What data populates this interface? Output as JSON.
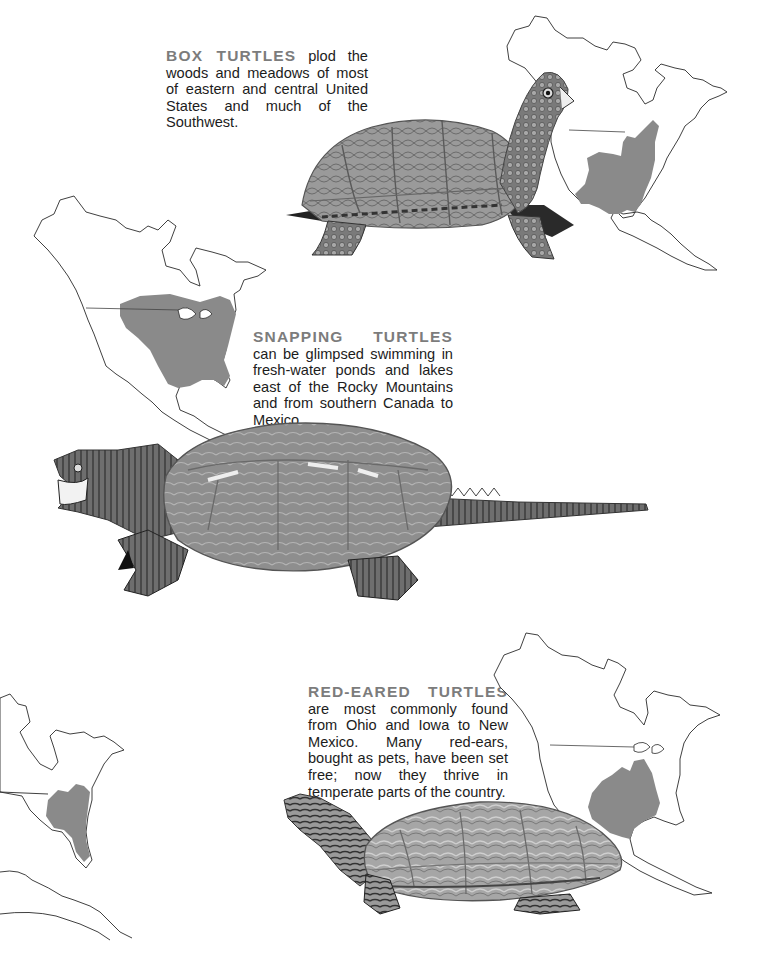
{
  "page": {
    "background": "#ffffff",
    "heading_color": "#7c7c7c",
    "range_fill_color": "#8a8a8a"
  },
  "sections": [
    {
      "id": "box",
      "heading": "BOX TURTLES",
      "body": " plod the woods and meadows of most of eastern and central United States and much of the Southwest.",
      "map_label": "box-turtle-range-map",
      "illustration": "box-turtle-illustration"
    },
    {
      "id": "snapping",
      "heading": "SNAPPING TURTLES",
      "body": " can be glimpsed swimming in fresh-water ponds and lakes east of the Rocky Mountains and from southern Canada to Mexico.",
      "map_label": "snapping-turtle-range-map",
      "illustration": "snapping-turtle-illustration"
    },
    {
      "id": "red_eared",
      "heading": "RED-EARED TURTLES",
      "body": " are most commonly found from Ohio and Iowa to New Mexico. Many red-ears, bought as pets, have been set free; now they thrive in temperate parts of the country.",
      "map_label": "red-eared-turtle-range-map",
      "illustration": "red-eared-turtle-illustration"
    }
  ],
  "partial_map": {
    "label": "eastern-range-map-partial"
  }
}
